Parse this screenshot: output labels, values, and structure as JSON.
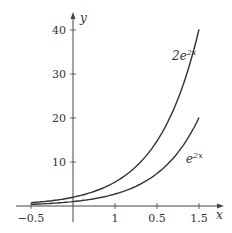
{
  "chart_data": {
    "type": "line",
    "title": "",
    "xlabel": "x",
    "ylabel": "y",
    "xlim": [
      -0.6,
      1.75
    ],
    "ylim": [
      0,
      43
    ],
    "grid": false,
    "x_ticks": [
      {
        "value": -0.5,
        "label": "−0.5"
      },
      {
        "value": 0.5,
        "label": "1"
      },
      {
        "value": 1.0,
        "label": "0.5"
      },
      {
        "value": 1.5,
        "label": "1.5"
      }
    ],
    "y_ticks": [
      {
        "value": 10,
        "label": "10"
      },
      {
        "value": 20,
        "label": "20"
      },
      {
        "value": 30,
        "label": "30"
      },
      {
        "value": 40,
        "label": "40"
      }
    ],
    "series": [
      {
        "name": "2e^{2x}",
        "label_base": "2e",
        "label_sup": "2x",
        "x": [
          -0.5,
          -0.25,
          0,
          0.25,
          0.5,
          0.75,
          1.0,
          1.25,
          1.5
        ],
        "values": [
          0.74,
          1.21,
          2.0,
          3.3,
          5.44,
          8.96,
          14.78,
          24.37,
          40.17
        ]
      },
      {
        "name": "e^{2x}",
        "label_base": "e",
        "label_sup": "2x",
        "x": [
          -0.5,
          -0.25,
          0,
          0.25,
          0.5,
          0.75,
          1.0,
          1.25,
          1.5
        ],
        "values": [
          0.37,
          0.61,
          1.0,
          1.65,
          2.72,
          4.48,
          7.39,
          12.18,
          20.09
        ]
      }
    ],
    "colors": {
      "axis": "#444444",
      "curve": "#333333",
      "text": "#333333"
    }
  }
}
